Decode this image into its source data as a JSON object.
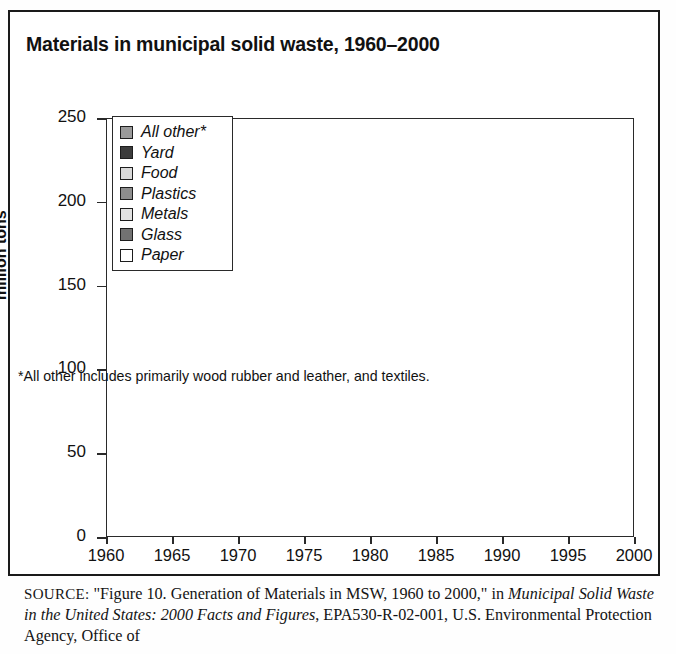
{
  "figure": {
    "title": "Materials in municipal solid waste, 1960–2000",
    "footnote": "*All other includes primarily wood rubber and leather, and textiles.",
    "source": {
      "prefix": "SOURCE:",
      "quoted": "\"Figure 10. Generation of Materials in MSW, 1960 to 2000,\" in",
      "italic_title": "Municipal Solid Waste in the United States: 2000 Facts and Figures",
      "tail": ", EPA530-R-02-001, U.S. Environmental Protection Agency, Office of"
    }
  },
  "legend": {
    "items": [
      {
        "label": "All other*",
        "color": "#9a9a9a"
      },
      {
        "label": "Yard",
        "color": "#3c3c3c"
      },
      {
        "label": "Food",
        "color": "#d9d9d9"
      },
      {
        "label": "Plastics",
        "color": "#8e8e8e"
      },
      {
        "label": "Metals",
        "color": "#e2e2e2"
      },
      {
        "label": "Glass",
        "color": "#727272"
      },
      {
        "label": "Paper",
        "color": "#ffffff"
      }
    ]
  },
  "axes": {
    "ylabel": "million tons",
    "yticks": [
      "0",
      "50",
      "100",
      "150",
      "200",
      "250"
    ],
    "xticks": [
      "1960",
      "1965",
      "1970",
      "1975",
      "1980",
      "1985",
      "1990",
      "1995",
      "2000"
    ]
  },
  "chart_data": {
    "type": "area",
    "stacked": true,
    "title": "Materials in municipal solid waste, 1960–2000",
    "xlabel": "",
    "ylabel": "million tons",
    "xlim": [
      1960,
      2000
    ],
    "ylim": [
      0,
      250
    ],
    "grid": false,
    "legend_position": "inside-top-left",
    "annotation": "*All other includes primarily wood rubber and leather, and textiles.",
    "units": "million tons",
    "x": [
      1960,
      1961,
      1962,
      1963,
      1964,
      1965,
      1966,
      1967,
      1968,
      1969,
      1970,
      1971,
      1972,
      1973,
      1974,
      1975,
      1976,
      1977,
      1978,
      1979,
      1980,
      1981,
      1982,
      1983,
      1984,
      1985,
      1986,
      1987,
      1988,
      1989,
      1990,
      1991,
      1992,
      1993,
      1994,
      1995,
      1996,
      1997,
      1998,
      1999,
      2000
    ],
    "stack_order_bottom_to_top": [
      "Paper",
      "Glass",
      "Metals",
      "Plastics",
      "Food",
      "Yard",
      "All other*"
    ],
    "series": [
      {
        "name": "Paper",
        "color": "#ffffff",
        "values": [
          29.9,
          30.8,
          32.0,
          33.1,
          35.3,
          36.4,
          38.5,
          39.0,
          41.3,
          43.0,
          44.3,
          44.9,
          47.9,
          50.2,
          47.4,
          43.6,
          49.8,
          51.7,
          52.5,
          55.6,
          55.2,
          56.0,
          54.6,
          58.6,
          62.4,
          62.9,
          65.2,
          69.7,
          72.8,
          72.1,
          72.7,
          73.6,
          77.8,
          80.1,
          84.1,
          82.2,
          83.7,
          85.4,
          85.6,
          87.3,
          86.7
        ]
      },
      {
        "name": "Glass",
        "color": "#727272",
        "values": [
          6.7,
          7.1,
          7.4,
          7.8,
          8.5,
          8.7,
          9.6,
          10.2,
          11.4,
          12.1,
          12.7,
          12.6,
          13.1,
          13.8,
          13.3,
          12.7,
          13.1,
          13.4,
          14.5,
          14.7,
          15.1,
          14.4,
          13.4,
          13.4,
          13.6,
          13.2,
          12.9,
          13.2,
          13.2,
          12.9,
          13.1,
          12.6,
          12.4,
          12.5,
          12.8,
          12.8,
          12.4,
          12.5,
          12.6,
          12.8,
          12.8
        ]
      },
      {
        "name": "Metals",
        "color": "#e2e2e2",
        "values": [
          10.5,
          10.6,
          10.8,
          11.1,
          11.6,
          11.8,
          12.2,
          12.4,
          13.0,
          13.5,
          13.8,
          13.6,
          14.0,
          14.5,
          14.1,
          13.1,
          13.6,
          13.8,
          14.0,
          14.4,
          14.5,
          14.3,
          13.8,
          14.0,
          14.6,
          14.7,
          14.8,
          15.2,
          15.6,
          15.6,
          16.0,
          15.6,
          15.7,
          15.9,
          16.4,
          16.6,
          16.3,
          16.6,
          16.9,
          17.4,
          17.9
        ]
      },
      {
        "name": "Plastics",
        "color": "#8e8e8e",
        "values": [
          0.4,
          0.5,
          0.6,
          0.7,
          0.9,
          1.4,
          1.7,
          2.0,
          2.4,
          2.8,
          2.9,
          3.3,
          3.8,
          4.2,
          4.3,
          4.4,
          5.0,
          5.4,
          6.1,
          6.6,
          6.8,
          7.4,
          7.8,
          8.6,
          9.6,
          10.2,
          11.0,
          12.0,
          13.0,
          14.1,
          17.1,
          17.8,
          18.7,
          19.4,
          20.5,
          21.0,
          21.8,
          22.6,
          23.6,
          24.4,
          24.7
        ]
      },
      {
        "name": "Food",
        "color": "#d9d9d9",
        "values": [
          12.2,
          12.3,
          12.4,
          12.5,
          12.6,
          12.7,
          12.8,
          12.9,
          13.0,
          13.1,
          12.8,
          12.9,
          13.0,
          13.1,
          13.2,
          13.2,
          13.3,
          13.4,
          13.5,
          13.6,
          13.0,
          13.2,
          13.3,
          13.5,
          13.6,
          13.8,
          14.6,
          17.0,
          20.0,
          21.7,
          23.9,
          22.6,
          22.3,
          21.8,
          22.1,
          21.6,
          21.9,
          22.1,
          22.5,
          23.0,
          25.9
        ]
      },
      {
        "name": "Yard",
        "color": "#3c3c3c",
        "values": [
          20.0,
          20.6,
          21.2,
          21.8,
          22.4,
          23.0,
          23.6,
          24.2,
          24.8,
          25.4,
          23.2,
          24.0,
          25.0,
          26.0,
          26.6,
          27.0,
          27.5,
          28.5,
          29.5,
          30.5,
          27.5,
          28.8,
          29.8,
          30.9,
          31.8,
          30.0,
          30.8,
          31.8,
          33.0,
          35.0,
          35.0,
          34.8,
          33.9,
          32.8,
          31.9,
          30.5,
          29.8,
          29.6,
          28.8,
          28.5,
          27.7
        ]
      },
      {
        "name": "All other*",
        "color": "#9a9a9a",
        "values": [
          8.3,
          8.6,
          8.9,
          9.2,
          9.6,
          9.9,
          10.4,
          10.8,
          11.4,
          11.9,
          12.4,
          12.6,
          13.2,
          13.8,
          13.6,
          13.2,
          14.0,
          14.5,
          15.1,
          15.7,
          16.1,
          16.3,
          16.2,
          16.9,
          17.8,
          18.3,
          19.0,
          20.0,
          21.0,
          21.6,
          22.5,
          22.3,
          23.0,
          23.6,
          24.4,
          24.6,
          25.0,
          25.5,
          26.1,
          26.7,
          26.8
        ]
      }
    ],
    "totals": [
      88.0,
      90.5,
      93.3,
      96.2,
      100.9,
      103.9,
      108.8,
      111.5,
      117.3,
      121.8,
      122.1,
      123.9,
      130.0,
      135.6,
      132.5,
      127.2,
      136.3,
      140.7,
      145.2,
      151.1,
      148.2,
      150.4,
      148.9,
      155.9,
      163.4,
      163.1,
      168.3,
      178.9,
      188.6,
      193.0,
      200.3,
      199.3,
      203.8,
      206.1,
      212.2,
      209.3,
      210.9,
      214.3,
      216.1,
      220.1,
      222.5
    ]
  }
}
